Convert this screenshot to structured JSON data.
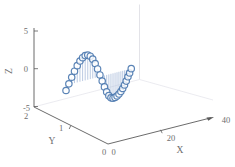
{
  "figure": {
    "background": "#ffffff",
    "axes": {
      "x": {
        "label": "X",
        "ticks": [
          "0",
          "20",
          "40"
        ],
        "range": [
          0,
          40
        ]
      },
      "y": {
        "label": "Y",
        "ticks": [
          "2",
          "1",
          "0"
        ],
        "range": [
          0,
          2
        ]
      },
      "z": {
        "label": "Z",
        "ticks": [
          "5",
          "0",
          "-5"
        ],
        "range": [
          -5,
          5
        ]
      }
    },
    "colors": {
      "marker_edge": "#4d79b0",
      "marker_fill": "#ffffff",
      "stem": "#a9bcdb",
      "axis": "#5a5a5a",
      "tick_label": "#6e6e6e",
      "pane_edge": "#dcdce2"
    }
  },
  "chart_data": {
    "type": "scatter",
    "subtype": "3d-stem",
    "title": "",
    "xlabel": "X",
    "ylabel": "Y",
    "zlabel": "Z",
    "xlim": [
      0,
      40
    ],
    "ylim": [
      0,
      2
    ],
    "zlim": [
      -5,
      5
    ],
    "grid": false,
    "legend": false,
    "baseline_z": 0,
    "y_const": 1,
    "marker": "open-circle",
    "x": [
      0.04,
      1.12,
      2.19,
      3.24,
      4.28,
      5.3,
      6.3,
      7.28,
      8.25,
      9.2,
      10.13,
      11.05,
      11.95,
      12.84,
      13.7,
      14.55,
      15.39,
      16.2,
      17.0,
      17.78,
      18.55,
      19.29,
      20.02,
      20.74,
      21.43,
      22.11,
      22.77,
      23.42,
      24.05,
      24.66
    ],
    "z": [
      -0.69,
      0.09,
      0.87,
      1.58,
      2.22,
      2.74,
      3.09,
      3.28,
      3.27,
      3.03,
      2.56,
      1.9,
      1.1,
      0.22,
      -0.67,
      -1.51,
      -2.25,
      -2.82,
      -3.18,
      -3.3,
      -3.26,
      -3.14,
      -2.95,
      -2.68,
      -2.34,
      -1.94,
      -1.48,
      -0.97,
      -0.52,
      0.0
    ]
  }
}
